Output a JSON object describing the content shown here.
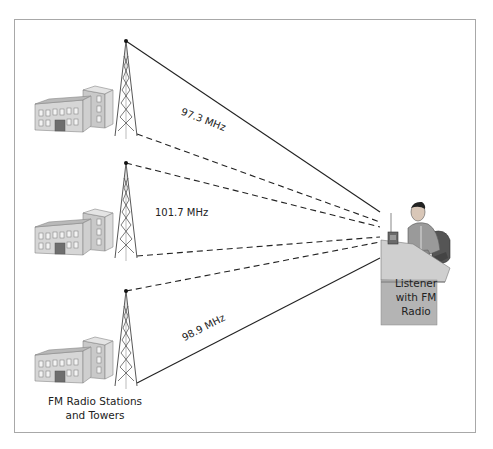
{
  "diagram": {
    "frequencies": [
      {
        "label": "97.3 MHz"
      },
      {
        "label": "101.7 MHz"
      },
      {
        "label": "98.9 MHz"
      }
    ],
    "listener_caption": [
      "Listener",
      "with FM",
      "Radio"
    ],
    "stations_caption": [
      "FM Radio Stations",
      "and Towers"
    ],
    "icons": [
      "building-icon",
      "radio-tower-icon",
      "listener-at-desk-icon",
      "radio-icon"
    ],
    "colors": {
      "line": "#222222",
      "frame": "#a8a8a8",
      "building_light": "#dcdcdc",
      "building_dark": "#a9a9a9",
      "desk": "#c8c8c8"
    }
  }
}
